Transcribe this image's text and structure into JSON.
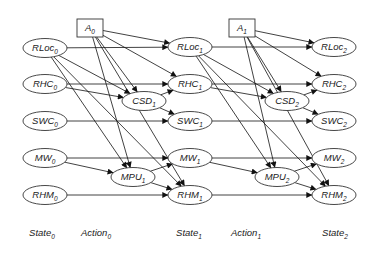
{
  "diagram": {
    "type": "dynamic-bayesian-network",
    "colors": {
      "stroke": "#333333",
      "fill": "#ffffff",
      "text": "#222222"
    },
    "nodes": [
      {
        "id": "A0",
        "base": "A",
        "sub": "0",
        "shape": "box",
        "x": 90,
        "y": 28
      },
      {
        "id": "RLoc0",
        "base": "RLoc",
        "sub": "0",
        "shape": "ellipse",
        "x": 45,
        "y": 48
      },
      {
        "id": "RHC0",
        "base": "RHC",
        "sub": "0",
        "shape": "ellipse",
        "x": 45,
        "y": 84
      },
      {
        "id": "SWC0",
        "base": "SWC",
        "sub": "0",
        "shape": "ellipse",
        "x": 45,
        "y": 121
      },
      {
        "id": "MW0",
        "base": "MW",
        "sub": "0",
        "shape": "ellipse",
        "x": 45,
        "y": 158
      },
      {
        "id": "RHM0",
        "base": "RHM",
        "sub": "0",
        "shape": "ellipse",
        "x": 45,
        "y": 195
      },
      {
        "id": "CSD1",
        "base": "CSD",
        "sub": "1",
        "shape": "ellipse",
        "x": 144,
        "y": 101
      },
      {
        "id": "MPU1",
        "base": "MPU",
        "sub": "1",
        "shape": "ellipse",
        "x": 133,
        "y": 177
      },
      {
        "id": "RLoc1",
        "base": "RLoc",
        "sub": "1",
        "shape": "ellipse",
        "x": 190,
        "y": 47
      },
      {
        "id": "RHC1",
        "base": "RHC",
        "sub": "1",
        "shape": "ellipse",
        "x": 190,
        "y": 84
      },
      {
        "id": "SWC1",
        "base": "SWC",
        "sub": "1",
        "shape": "ellipse",
        "x": 190,
        "y": 121
      },
      {
        "id": "MW1",
        "base": "MW",
        "sub": "1",
        "shape": "ellipse",
        "x": 190,
        "y": 158
      },
      {
        "id": "RHM1",
        "base": "RHM",
        "sub": "1",
        "shape": "ellipse",
        "x": 190,
        "y": 195
      },
      {
        "id": "A1",
        "base": "A",
        "sub": "1",
        "shape": "box",
        "x": 242,
        "y": 28
      },
      {
        "id": "CSD2",
        "base": "CSD",
        "sub": "2",
        "shape": "ellipse",
        "x": 287,
        "y": 101
      },
      {
        "id": "MPU2",
        "base": "MPU",
        "sub": "2",
        "shape": "ellipse",
        "x": 277,
        "y": 177
      },
      {
        "id": "RLoc2",
        "base": "RLoc",
        "sub": "2",
        "shape": "ellipse",
        "x": 334,
        "y": 47
      },
      {
        "id": "RHC2",
        "base": "RHC",
        "sub": "2",
        "shape": "ellipse",
        "x": 334,
        "y": 84
      },
      {
        "id": "SWC2",
        "base": "SWC",
        "sub": "2",
        "shape": "ellipse",
        "x": 334,
        "y": 121
      },
      {
        "id": "MW2",
        "base": "MW",
        "sub": "2",
        "shape": "ellipse",
        "x": 334,
        "y": 158
      },
      {
        "id": "RHM2",
        "base": "RHM",
        "sub": "2",
        "shape": "ellipse",
        "x": 334,
        "y": 195
      }
    ],
    "edges": [
      [
        "A0",
        "RLoc1"
      ],
      [
        "A0",
        "RHC1"
      ],
      [
        "A0",
        "CSD1"
      ],
      [
        "A0",
        "MPU1"
      ],
      [
        "A0",
        "RHM1"
      ],
      [
        "RLoc0",
        "RLoc1"
      ],
      [
        "RLoc0",
        "CSD1"
      ],
      [
        "RLoc0",
        "MPU1"
      ],
      [
        "RLoc0",
        "RHM1"
      ],
      [
        "RHC0",
        "RHC1"
      ],
      [
        "RHC0",
        "CSD1"
      ],
      [
        "CSD1",
        "RHC1"
      ],
      [
        "CSD1",
        "SWC1"
      ],
      [
        "SWC0",
        "SWC1"
      ],
      [
        "MW0",
        "MW1"
      ],
      [
        "MW0",
        "MPU1"
      ],
      [
        "MPU1",
        "MW1"
      ],
      [
        "MPU1",
        "RHM1"
      ],
      [
        "RHM0",
        "RHM1"
      ],
      [
        "A1",
        "RLoc2"
      ],
      [
        "A1",
        "RHC2"
      ],
      [
        "A1",
        "CSD2"
      ],
      [
        "A1",
        "MPU2"
      ],
      [
        "A1",
        "RHM2"
      ],
      [
        "RLoc1",
        "RLoc2"
      ],
      [
        "RLoc1",
        "CSD2"
      ],
      [
        "RLoc1",
        "MPU2"
      ],
      [
        "RLoc1",
        "RHM2"
      ],
      [
        "RHC1",
        "RHC2"
      ],
      [
        "RHC1",
        "CSD2"
      ],
      [
        "CSD2",
        "RHC2"
      ],
      [
        "CSD2",
        "SWC2"
      ],
      [
        "SWC1",
        "SWC2"
      ],
      [
        "MW1",
        "MW2"
      ],
      [
        "MW1",
        "MPU2"
      ],
      [
        "MPU2",
        "MW2"
      ],
      [
        "MPU2",
        "RHM2"
      ],
      [
        "RHM1",
        "RHM2"
      ]
    ],
    "column_labels": [
      {
        "base": "State",
        "sub": "0",
        "x": 42,
        "y": 236
      },
      {
        "base": "Action",
        "sub": "0",
        "x": 96,
        "y": 236
      },
      {
        "base": "State",
        "sub": "1",
        "x": 189,
        "y": 236
      },
      {
        "base": "Action",
        "sub": "1",
        "x": 246,
        "y": 236
      },
      {
        "base": "State",
        "sub": "2",
        "x": 335,
        "y": 236
      }
    ]
  }
}
